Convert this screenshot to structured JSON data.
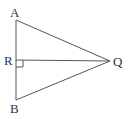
{
  "diagram": {
    "type": "geometry",
    "colors": {
      "stroke": "#555555",
      "label": "#333333",
      "background": "#ffffff"
    },
    "points": {
      "A": {
        "label": "A",
        "x": 16,
        "y": 20
      },
      "B": {
        "label": "B",
        "x": 16,
        "y": 100
      },
      "R": {
        "label": "R",
        "x": 16,
        "y": 60
      },
      "Q": {
        "label": "Q",
        "x": 110,
        "y": 61
      }
    },
    "segments": [
      {
        "from": "A",
        "to": "B"
      },
      {
        "from": "A",
        "to": "Q"
      },
      {
        "from": "B",
        "to": "Q"
      },
      {
        "from": "R",
        "to": "Q"
      }
    ],
    "right_angle_marker": {
      "at": "R",
      "size": 7
    }
  }
}
